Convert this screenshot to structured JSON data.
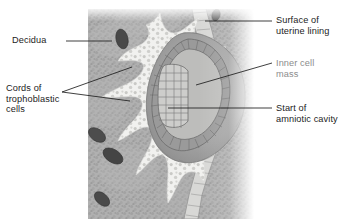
{
  "figure": {
    "type": "histological-illustration",
    "canvas": {
      "width": 353,
      "height": 219,
      "background": "#ffffff"
    },
    "tissue_block": {
      "x": 88,
      "y": 9,
      "width": 166,
      "height": 210
    }
  },
  "labels": [
    {
      "id": "decidua",
      "text": "Decidua",
      "color": "#1c1c1c",
      "x": 12,
      "y": 36,
      "align": "left",
      "leader": {
        "type": "straight",
        "points": "66,41 112,41"
      }
    },
    {
      "id": "cords-of-trophoblastic-cells",
      "text": "Cords of\ntrophoblastic\ncells",
      "color": "#1c1c1c",
      "x": 6,
      "y": 84,
      "align": "left",
      "leader": {
        "type": "fork",
        "points_upper": "62,92 132,67",
        "points_lower": "62,92 130,101"
      }
    },
    {
      "id": "surface-of-uterine-lining",
      "text": "Surface of\nuterine lining",
      "color": "#1c1c1c",
      "x": 276,
      "y": 16,
      "align": "left",
      "leader": {
        "type": "straight",
        "points": "272,21 205,21"
      }
    },
    {
      "id": "inner-cell-mass",
      "text": "Inner cell\nmass",
      "color": "#8c8c8c",
      "x": 276,
      "y": 59,
      "align": "left",
      "leader": {
        "type": "straight",
        "points": "272,63 196,85"
      }
    },
    {
      "id": "start-of-amniotic-cavity",
      "text": "Start of\namniotic cavity",
      "color": "#1c1c1c",
      "x": 276,
      "y": 104,
      "align": "left",
      "leader": {
        "type": "straight",
        "points": "272,108 168,108"
      }
    }
  ],
  "anatomy": {
    "decidua_label": "Decidua",
    "trophoblast_label": "Cords of trophoblastic cells",
    "surface_label": "Surface of uterine lining",
    "inner_cell_mass_label": "Inner cell mass",
    "amniotic_cavity_label": "Start of amniotic cavity",
    "blood_vessel_count": 5
  },
  "colors": {
    "decidua_base": "#a9a9a9",
    "decidua_light": "#bdbdbd",
    "trophoblast_cords": "#f2f2f0",
    "blastocyst_fill": "#a0a0a0",
    "trophoblast_ring": "#8d8d8d",
    "inner_cell_mass": "#c8c8c6",
    "vessel_dark": "#4a4a4a",
    "outline": "#6e6e6e",
    "label_dark": "#1c1c1c",
    "label_muted": "#8c8c8c"
  }
}
